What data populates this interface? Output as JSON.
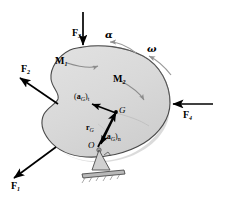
{
  "figure": {
    "body_fill": "#d9d9d9",
    "body_stroke": "#4a4a4a",
    "arrow_color": "#000000",
    "rotation_arrow_color": "#9a9a9a",
    "moment_arrow_color": "#8c8c8c"
  },
  "forces": [
    {
      "id": "F1",
      "label": "F",
      "sub": "1",
      "dir": "down-left"
    },
    {
      "id": "F2",
      "label": "F",
      "sub": "2",
      "dir": "up-left"
    },
    {
      "id": "F3",
      "label": "F",
      "sub": "3",
      "dir": "down"
    },
    {
      "id": "F4",
      "label": "F",
      "sub": "4",
      "dir": "left"
    }
  ],
  "moments": [
    {
      "id": "M1",
      "label": "M",
      "sub": "1"
    },
    {
      "id": "M2",
      "label": "M",
      "sub": "2"
    }
  ],
  "rotation": [
    {
      "id": "alpha",
      "label": "α",
      "meaning": "angular-acceleration"
    },
    {
      "id": "omega",
      "label": "ω",
      "meaning": "angular-velocity"
    }
  ],
  "points": [
    {
      "id": "G",
      "label": "G",
      "meaning": "center-of-mass"
    },
    {
      "id": "O",
      "label": "O",
      "meaning": "pin-support-origin"
    }
  ],
  "vectors": [
    {
      "id": "aGt",
      "prefix": "(",
      "bold": "a",
      "sub1": "G",
      "suffix": ")",
      "sub2": "t"
    },
    {
      "id": "aGn",
      "prefix": "(",
      "bold": "a",
      "sub1": "G",
      "suffix": ")",
      "sub2": "n"
    },
    {
      "id": "rG",
      "bold": "r",
      "sub1": "G"
    }
  ]
}
